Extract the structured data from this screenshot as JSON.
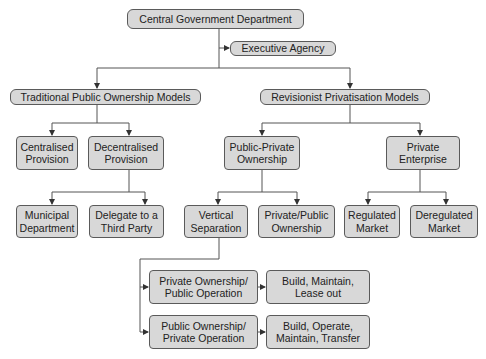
{
  "diagram": {
    "root": "Central Government Department",
    "executive_agency": "Executive Agency",
    "traditional": {
      "title": "Traditional Public Ownership Models",
      "centralised": "Centralised Provision",
      "decentralised": "Decentralised Provision",
      "municipal": "Municipal Department",
      "delegate": "Delegate to a Third Party"
    },
    "revisionist": {
      "title": "Revisionist Privatisation Models",
      "public_private": "Public-Private Ownership",
      "private_enterprise": "Private Enterprise",
      "vertical_separation": "Vertical Separation",
      "private_public_ownership": "Private/Public Ownership",
      "regulated": "Regulated Market",
      "deregulated": "Deregulated Market",
      "priv_own_pub_op": "Private Ownership/ Public Operation",
      "pub_own_priv_op": "Public Ownership/ Private Operation",
      "bml": "Build, Maintain, Lease out",
      "bomt": "Build, Operate, Maintain, Transfer"
    },
    "colors": {
      "box_fill": "#d8d8d8",
      "box_border": "#5a5a5a",
      "line": "#555555"
    }
  }
}
